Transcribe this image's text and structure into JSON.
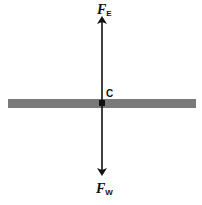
{
  "diagram": {
    "title": "",
    "bar": {
      "color": "#7a7a7a"
    },
    "center_label": "C",
    "forces": [
      {
        "name": "F",
        "subscript": "E",
        "direction": "up"
      },
      {
        "name": "F",
        "subscript": "W",
        "direction": "down"
      }
    ],
    "arrow_color": "#111111"
  }
}
